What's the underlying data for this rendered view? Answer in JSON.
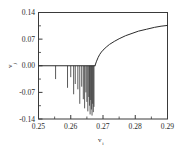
{
  "chart_data": {
    "type": "line",
    "title": "",
    "subtitle": "",
    "xlabel": "v_i",
    "xlabel_base": "v",
    "xlabel_subscript": "i",
    "ylabel": "v_j",
    "ylabel_base": "v",
    "ylabel_subscript": "j",
    "xlim": [
      0.25,
      0.29
    ],
    "ylim": [
      -0.14,
      0.14
    ],
    "xticks": [
      0.25,
      0.26,
      0.27,
      0.28,
      0.29
    ],
    "xticklabels": [
      "0.25",
      "0.26",
      "0.27",
      "0.28",
      "0.29"
    ],
    "yticks": [
      -0.14,
      -0.07,
      0.0,
      0.07,
      0.14
    ],
    "yticklabels": [
      "-0.14",
      "-0.07",
      "0.00",
      "0.07",
      "0.14"
    ],
    "xminorticks": [
      0.255,
      0.265,
      0.275,
      0.285
    ],
    "yminorticks": [
      -0.105,
      -0.035,
      0.035,
      0.105
    ],
    "grid": false,
    "legend": null,
    "frame": "box",
    "transition_x": 0.2675,
    "series": [
      {
        "name": "baseline-branch",
        "comment": "flat zero branch before bifurcation",
        "x": [
          0.25,
          0.2675
        ],
        "values": [
          0.0,
          0.0
        ]
      },
      {
        "name": "upper-branch",
        "comment": "rising concave branch after bifurcation",
        "x": [
          0.2675,
          0.268,
          0.2685,
          0.269,
          0.2695,
          0.27,
          0.271,
          0.272,
          0.2735,
          0.275,
          0.277,
          0.279,
          0.281,
          0.2835,
          0.286,
          0.288,
          0.29
        ],
        "values": [
          0.0,
          0.012,
          0.022,
          0.03,
          0.036,
          0.041,
          0.049,
          0.056,
          0.064,
          0.071,
          0.079,
          0.085,
          0.091,
          0.096,
          0.101,
          0.104,
          0.106
        ]
      }
    ],
    "spikes": {
      "comment": "downward excursions from the zero branch; depth in data units",
      "x": [
        0.2553,
        0.259,
        0.26,
        0.2609,
        0.2614,
        0.2622,
        0.2628,
        0.2634,
        0.2639,
        0.2643,
        0.2647,
        0.265,
        0.2653,
        0.2656,
        0.2658,
        0.266,
        0.2662,
        0.2664,
        0.2666,
        0.2668,
        0.267,
        0.2672
      ],
      "depths": [
        -0.035,
        -0.058,
        -0.03,
        -0.075,
        -0.048,
        -0.062,
        -0.1,
        -0.055,
        -0.088,
        -0.112,
        -0.07,
        -0.095,
        -0.12,
        -0.082,
        -0.105,
        -0.128,
        -0.09,
        -0.115,
        -0.131,
        -0.1,
        -0.122,
        -0.108
      ]
    }
  }
}
